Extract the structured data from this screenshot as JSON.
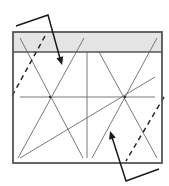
{
  "canvas": {
    "width": 169,
    "height": 186,
    "background": "#ffffff"
  },
  "colors": {
    "frame": "#555555",
    "band_fill": "#e4e4e4",
    "thin_line": "#6a6a6a",
    "arrow": "#1a1a1a",
    "dashed": "#2a2a2a"
  },
  "frame": {
    "x": 13,
    "y": 32,
    "width": 149,
    "height": 131
  },
  "top_band": {
    "x": 13,
    "y": 32,
    "width": 149,
    "height": 20
  },
  "band_separator": {
    "x1": 13,
    "y1": 52,
    "x2": 162,
    "y2": 52
  },
  "vertical_divider": {
    "x1": 87,
    "y1": 52,
    "x2": 87,
    "y2": 158
  },
  "horizontal_line": {
    "x1": 20,
    "y1": 97,
    "x2": 155,
    "y2": 97
  },
  "solid_lines": [
    {
      "name": "left-x-line-1",
      "x1": 20,
      "y1": 38,
      "x2": 83,
      "y2": 158
    },
    {
      "name": "left-x-line-2",
      "x1": 84,
      "y1": 38,
      "x2": 18,
      "y2": 158
    },
    {
      "name": "right-x-line-1",
      "x1": 99,
      "y1": 52,
      "x2": 157,
      "y2": 158
    },
    {
      "name": "right-x-line-2",
      "x1": 157,
      "y1": 38,
      "x2": 92,
      "y2": 158
    },
    {
      "name": "long-diagonal",
      "x1": 20,
      "y1": 158,
      "x2": 155,
      "y2": 77
    }
  ],
  "dashed_lines": [
    {
      "name": "left-dashed-line",
      "x1": 45,
      "y1": 36,
      "x2": 11,
      "y2": 98
    },
    {
      "name": "right-dashed-line",
      "x1": 164,
      "y1": 97,
      "x2": 126,
      "y2": 161
    }
  ],
  "arrows": [
    {
      "name": "top-pointer-arrow",
      "points": "16,26 48,15 61,62",
      "tip": {
        "x": 62,
        "y": 65
      }
    },
    {
      "name": "bottom-pointer-arrow",
      "points": "159,169 126,181 111,134",
      "tip": {
        "x": 110,
        "y": 131
      }
    }
  ],
  "intersections": [
    {
      "name": "left-crossing",
      "x": 50,
      "y": 97
    },
    {
      "name": "right-crossing",
      "x": 125,
      "y": 97
    }
  ]
}
